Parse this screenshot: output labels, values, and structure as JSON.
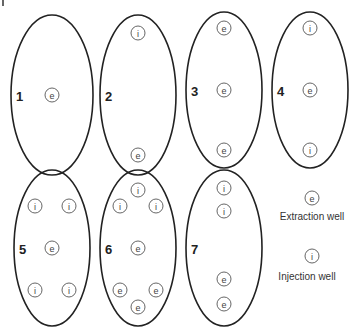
{
  "legend": {
    "extraction": {
      "symbol": "e",
      "label": "Extraction well"
    },
    "injection": {
      "symbol": "i",
      "label": "Injection well"
    }
  },
  "patterns": [
    {
      "number": "1",
      "wells": [
        {
          "type": "e",
          "pos": "center"
        }
      ]
    },
    {
      "number": "2",
      "wells": [
        {
          "type": "i",
          "pos": "top"
        },
        {
          "type": "e",
          "pos": "bottom"
        }
      ]
    },
    {
      "number": "3",
      "wells": [
        {
          "type": "e",
          "pos": "top"
        },
        {
          "type": "e",
          "pos": "center"
        },
        {
          "type": "e",
          "pos": "bottom"
        }
      ]
    },
    {
      "number": "4",
      "wells": [
        {
          "type": "i",
          "pos": "top"
        },
        {
          "type": "e",
          "pos": "center"
        },
        {
          "type": "i",
          "pos": "bottom"
        }
      ]
    },
    {
      "number": "5",
      "wells": [
        {
          "type": "i",
          "pos": "top-left"
        },
        {
          "type": "i",
          "pos": "top-right"
        },
        {
          "type": "e",
          "pos": "center"
        },
        {
          "type": "i",
          "pos": "bottom-left"
        },
        {
          "type": "i",
          "pos": "bottom-right"
        }
      ]
    },
    {
      "number": "6",
      "wells": [
        {
          "type": "i",
          "pos": "top"
        },
        {
          "type": "i",
          "pos": "top-left"
        },
        {
          "type": "i",
          "pos": "top-right"
        },
        {
          "type": "e",
          "pos": "center"
        },
        {
          "type": "e",
          "pos": "bottom-left"
        },
        {
          "type": "e",
          "pos": "bottom-right"
        },
        {
          "type": "e",
          "pos": "bottom"
        }
      ]
    },
    {
      "number": "7",
      "wells": [
        {
          "type": "i",
          "pos": "top"
        },
        {
          "type": "i",
          "pos": "upper"
        },
        {
          "type": "e",
          "pos": "lower"
        },
        {
          "type": "e",
          "pos": "bottom"
        }
      ]
    }
  ]
}
